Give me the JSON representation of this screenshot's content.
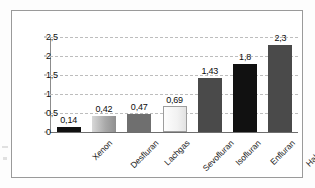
{
  "chart_data": {
    "type": "bar",
    "title": "",
    "xlabel": "",
    "ylabel": "",
    "categories": [
      "Xenon",
      "Desfluran",
      "Lachgas",
      "Sevofluran",
      "Isofluran",
      "Enfluran",
      "Halothan"
    ],
    "values": [
      0.14,
      0.42,
      0.47,
      0.69,
      1.43,
      1.8,
      2.3
    ],
    "value_labels": [
      "0,14",
      "0,42",
      "0,47",
      "0,69",
      "1,43",
      "1,8",
      "2,3"
    ],
    "ylim": [
      0,
      2.5
    ],
    "y_ticks": [
      0,
      0.5,
      1,
      1.5,
      2,
      2.5
    ],
    "y_tick_labels": [
      "0",
      "0,5",
      "1",
      "1,5",
      "2",
      "2,5"
    ],
    "grid": true,
    "grid_style": "dashed-horizontal",
    "legend": false,
    "legend_position": "none",
    "decimal_separator": ",",
    "bar_fills": [
      "black",
      "gray-gradient",
      "medium-gray",
      "light-white",
      "dark-gray",
      "black",
      "dark-gray"
    ],
    "colors": {
      "black": "#111111",
      "gray_gradient_start": "#d8d8d8",
      "gray_gradient_end": "#8f8f8f",
      "medium_gray": "#6f6f6f",
      "light_white": "#fdfdfd",
      "dark_gray": "#4a4a4a",
      "darker_gray": "#3f3f3f",
      "gridline": "#bdbdbd",
      "axis": "#8c8c8c",
      "frame": "#9a9a9a",
      "text": "#111111",
      "background": "#ffffff"
    }
  }
}
